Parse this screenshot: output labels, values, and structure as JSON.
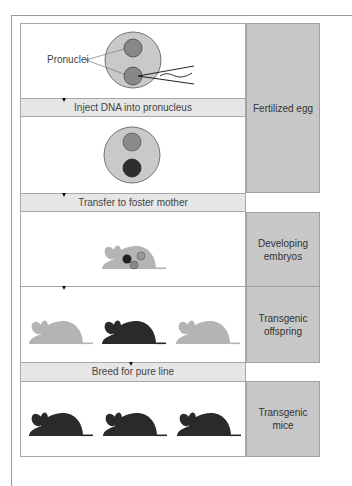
{
  "diagram": {
    "steps": [
      {
        "id": "inject",
        "label": "Inject DNA into pronucleus"
      },
      {
        "id": "transfer",
        "label": "Transfer to foster mother"
      },
      {
        "id": "breed",
        "label": "Breed for pure line"
      }
    ],
    "stages": [
      {
        "id": "fertilized-egg",
        "label": "Fertilized egg"
      },
      {
        "id": "developing-embryos",
        "label": "Developing embryos",
        "lines": [
          "Developing",
          "embryos"
        ]
      },
      {
        "id": "transgenic-offspring",
        "label": "Transgenic offspring",
        "lines": [
          "Transgenic",
          "offspring"
        ]
      },
      {
        "id": "transgenic-mice",
        "label": "Transgenic mice",
        "lines": [
          "Transgenic",
          "mice"
        ]
      }
    ],
    "annotations": {
      "pronuclei": "Pronuclei"
    },
    "colors": {
      "egg": "#c9c9c9",
      "pronucleus_gray": "#8a8a8a",
      "pronucleus_dark": "#2e2e2e",
      "mouse_light": "#b4b4b4",
      "mouse_dark": "#2a2a2a",
      "stage_box": "#c8c8c8",
      "step_bar": "#e6e6e6"
    },
    "offspring": [
      "non-transgenic",
      "transgenic",
      "non-transgenic"
    ],
    "final_mice": [
      "transgenic",
      "transgenic",
      "transgenic"
    ]
  }
}
